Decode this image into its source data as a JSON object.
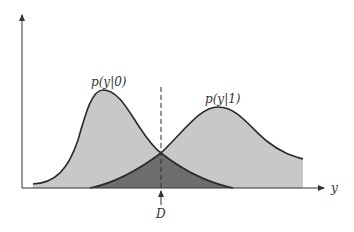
{
  "diagram": {
    "labels": {
      "left_curve": "p(y|0)",
      "right_curve": "p(y|1)",
      "x_axis": "y",
      "threshold": "D"
    },
    "colors": {
      "curve_fill": "#c8c8c8",
      "overlap_fill": "#6e6e6e",
      "stroke": "#2a2a2a",
      "background": "#ffffff"
    }
  }
}
